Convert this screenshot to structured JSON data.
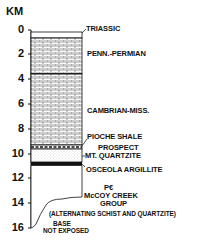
{
  "diagram": {
    "type": "stratigraphic-column",
    "axis": {
      "title": "KM",
      "ticks": [
        "0",
        "2",
        "4",
        "6",
        "8",
        "10",
        "12",
        "14",
        "16"
      ]
    },
    "units": [
      {
        "name": "TRIASSIC",
        "top_km": 0,
        "base_km": 0.5,
        "pattern": "blank"
      },
      {
        "name": "PENN.-PERMIAN",
        "top_km": 0.5,
        "base_km": 3.5,
        "pattern": "limestone-brick"
      },
      {
        "name": "CAMBRIAN-MISS.",
        "top_km": 3.5,
        "base_km": 9.3,
        "pattern": "limestone-brick"
      },
      {
        "name": "PIOCHE SHALE",
        "top_km": 9.3,
        "base_km": 9.6,
        "pattern": "dashed-shale"
      },
      {
        "name": "PROSPECT MT. QUARTZITE",
        "top_km": 9.6,
        "base_km": 10.7,
        "pattern": "dotted-sandstone"
      },
      {
        "name": "OSCEOLA ARGILLITE",
        "top_km": 10.7,
        "base_km": 11.0,
        "pattern": "solid-black"
      },
      {
        "name": "PC McCOY CREEK GROUP",
        "top_km": 11.0,
        "base_km": 16,
        "pattern": "blank"
      }
    ],
    "labels": {
      "triassic": "TRIASSIC",
      "penn_permian": "PENN.-PERMIAN",
      "cambrian_miss": "CAMBRIAN-MISS.",
      "pioche": "PIOCHE SHALE",
      "prospect_line1": "PROSPECT",
      "prospect_line2": "MT. QUARTZITE",
      "osceola": "OSCEOLA ARGILLITE",
      "mccoy_line1": "P€",
      "mccoy_line2": "McCOY CREEK",
      "mccoy_line3": "GROUP",
      "mccoy_note": "(ALTERNATING SCHIST AND QUARTZITE)",
      "base_line1": "BASE",
      "base_line2": "NOT EXPOSED"
    }
  }
}
